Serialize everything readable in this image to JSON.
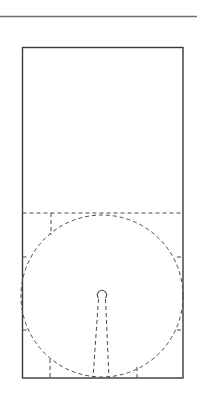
{
  "canvas": {
    "width": 198,
    "height": 411,
    "background": "#ffffff"
  },
  "colors": {
    "solid": "#3a3a3a",
    "dashed": "#4a4a4a",
    "rule": "#6e6e6e"
  },
  "top_rule": {
    "x1": 0,
    "y1": 16.5,
    "x2": 197,
    "y2": 16.5,
    "width": 1.3
  },
  "outer_rect": {
    "x": 22.5,
    "y": 47.5,
    "w": 160.5,
    "h": 330.5,
    "width": 1.4
  },
  "dash_pattern": "4 3",
  "h_dashed": {
    "x1": 22.5,
    "y1": 213,
    "x2": 183,
    "y2": 213
  },
  "circle": {
    "cx": 102,
    "cy": 296,
    "r": 81
  },
  "construction_lines": [
    {
      "x1": 51,
      "y1": 213,
      "x2": 51,
      "y2": 235
    },
    {
      "x1": 22.5,
      "y1": 257,
      "x2": 28,
      "y2": 257
    },
    {
      "x1": 177,
      "y1": 257,
      "x2": 183,
      "y2": 257
    },
    {
      "x1": 22.5,
      "y1": 330,
      "x2": 28,
      "y2": 330
    },
    {
      "x1": 177,
      "y1": 330,
      "x2": 183,
      "y2": 330
    },
    {
      "x1": 50,
      "y1": 359,
      "x2": 50,
      "y2": 378
    },
    {
      "x1": 137,
      "y1": 367,
      "x2": 137,
      "y2": 378
    }
  ],
  "keyhole": {
    "head": {
      "cx": 102,
      "cy": 295,
      "r": 4.5
    },
    "left_stem": {
      "x1": 98.5,
      "y1": 299,
      "x2": 93,
      "y2": 378
    },
    "right_stem": {
      "x1": 105.5,
      "y1": 299,
      "x2": 109,
      "y2": 378
    }
  }
}
